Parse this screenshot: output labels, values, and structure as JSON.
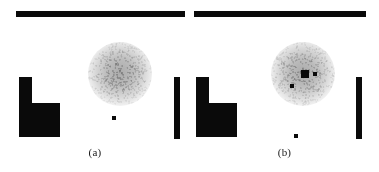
{
  "figure": {
    "width": 379,
    "height": 172,
    "background": "#ffffff",
    "ink_color": "#0a0a0a",
    "blob_color": "#8f8f8f",
    "type": "two-panel-grayscale-figure"
  },
  "panels": [
    {
      "id": "a",
      "caption": "(a)",
      "caption_x": 105,
      "caption_y": 146,
      "shapes": [
        {
          "name": "top-horizontal-bar",
          "x": 16,
          "y": 11,
          "w": 169,
          "h": 6
        },
        {
          "name": "l-block-stem",
          "x": 19,
          "y": 77,
          "w": 13,
          "h": 60
        },
        {
          "name": "l-block-foot",
          "x": 19,
          "y": 103,
          "w": 41,
          "h": 34
        },
        {
          "name": "right-vertical-bar",
          "x": 174,
          "y": 77,
          "w": 6,
          "h": 62
        }
      ],
      "blob": {
        "name": "noise-blob",
        "cx": 120,
        "cy": 74,
        "r": 32,
        "intensity": 0.62
      },
      "markers": [
        {
          "name": "marker-dot-lower",
          "x": 112,
          "y": 116,
          "w": 4,
          "h": 4
        }
      ]
    },
    {
      "id": "b",
      "caption": "(b)",
      "caption_x": 105,
      "caption_y": 146,
      "shapes": [
        {
          "name": "top-horizontal-bar",
          "x": 4,
          "y": 11,
          "w": 172,
          "h": 6
        },
        {
          "name": "l-block-stem",
          "x": 6,
          "y": 77,
          "w": 13,
          "h": 60
        },
        {
          "name": "l-block-foot",
          "x": 6,
          "y": 103,
          "w": 41,
          "h": 34
        },
        {
          "name": "right-vertical-bar",
          "x": 166,
          "y": 77,
          "w": 6,
          "h": 62
        }
      ],
      "blob": {
        "name": "noise-blob",
        "cx": 113,
        "cy": 74,
        "r": 32,
        "intensity": 0.62
      },
      "markers": [
        {
          "name": "marker-square-center",
          "x": 111,
          "y": 70,
          "w": 8,
          "h": 8
        },
        {
          "name": "marker-dot-right",
          "x": 123,
          "y": 72,
          "w": 4,
          "h": 4
        },
        {
          "name": "marker-dot-lowerleft",
          "x": 100,
          "y": 84,
          "w": 4,
          "h": 4
        },
        {
          "name": "marker-dot-below",
          "x": 104,
          "y": 134,
          "w": 4,
          "h": 4
        }
      ]
    }
  ]
}
